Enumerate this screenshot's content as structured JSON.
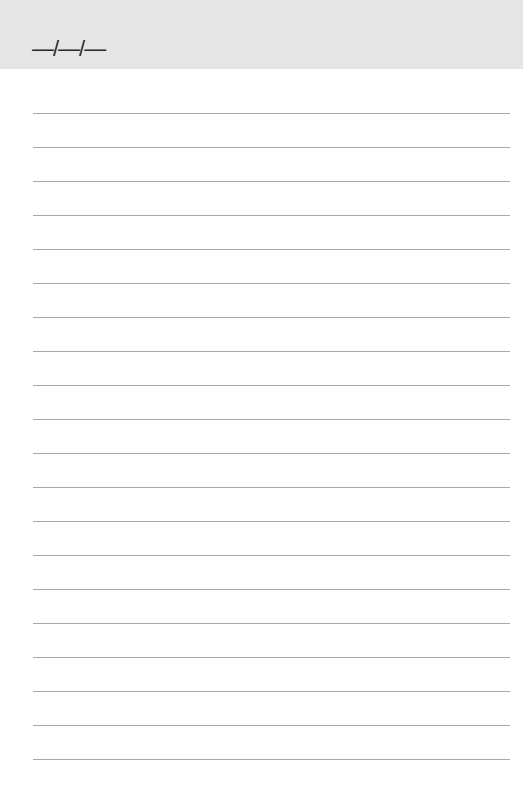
{
  "header": {
    "date_placeholder": "—/—/—",
    "background": "#e5e5e5"
  },
  "page": {
    "background": "#ffffff",
    "rule_color": "#a8a8a8",
    "rule_count": 20,
    "first_rule_y": 113,
    "rule_spacing": 34
  }
}
